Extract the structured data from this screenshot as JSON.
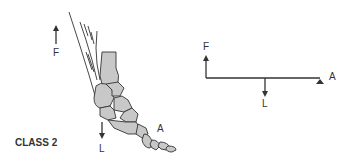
{
  "figure": {
    "class_label": "CLASS 2",
    "colors": {
      "bone_fill": "#c8c8c8",
      "stroke": "#333333",
      "text": "#333333"
    },
    "anatomical": {
      "effort_label": "F",
      "load_label": "L",
      "axis_label": "A",
      "effort_arrow_icon": "arrow-up",
      "load_arrow_icon": "arrow-down"
    },
    "schematic": {
      "effort_label": "F",
      "load_label": "L",
      "axis_label": "A",
      "effort_arrow_icon": "arrow-up",
      "load_arrow_icon": "arrow-down",
      "fulcrum_icon": "triangle-up"
    }
  }
}
